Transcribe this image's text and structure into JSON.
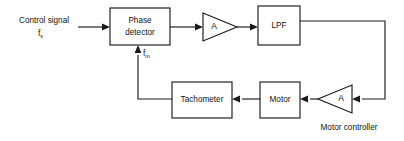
{
  "diagram": {
    "caption": "Motor controller",
    "colors": {
      "background": "#ffffff",
      "line": "#1a1a1a",
      "text": "#121212"
    },
    "input_label": {
      "line1": "Control signal",
      "symbol": "f",
      "subscript": "s"
    },
    "feedback_label": {
      "symbol": "f",
      "subscript": "m"
    },
    "blocks": [
      {
        "id": "phase-detector",
        "shape": "rect",
        "label_line1": "Phase",
        "label_line2": "detector"
      },
      {
        "id": "amplifier-forward",
        "shape": "triangle-right",
        "label": "A"
      },
      {
        "id": "low-pass-filter",
        "shape": "rect",
        "label": "LPF"
      },
      {
        "id": "amplifier-feedback",
        "shape": "triangle-left",
        "label": "A"
      },
      {
        "id": "motor",
        "shape": "rect",
        "label": "Motor"
      },
      {
        "id": "tachometer",
        "shape": "rect",
        "label": "Tachometer"
      }
    ]
  }
}
